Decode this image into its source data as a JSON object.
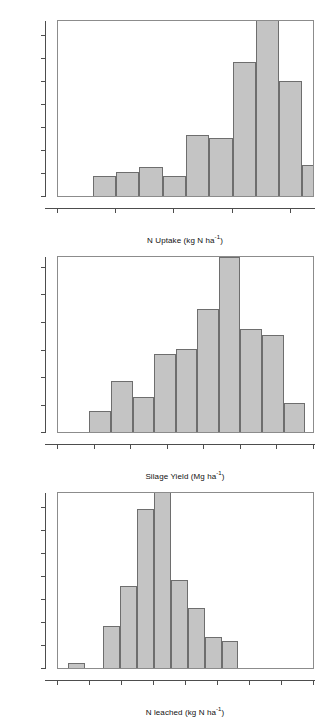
{
  "figure": {
    "panel_count": 3,
    "bar_fill": "#c4c4c4",
    "bar_stroke": "#6e6e6e",
    "axis_color": "#4d4d4d"
  },
  "chart_data": [
    {
      "type": "bar",
      "id": "n-uptake",
      "title": "",
      "xlabel_parts": {
        "pre": "N Uptake (kg N ha",
        "sup": "-1",
        "post": ")"
      },
      "xlabel": "N Uptake (kg N ha-1)",
      "ylabel": "Probability",
      "annotation": "90% Confidence Interval (95,361)",
      "xlim": [
        0,
        440
      ],
      "ylim": [
        0,
        0.2555
      ],
      "grid": false,
      "legend": "none",
      "xticks": [
        0,
        100,
        200,
        300,
        400
      ],
      "xtick_labels": [
        "0",
        "100",
        "200",
        "300",
        "400"
      ],
      "yticks": [
        0.0,
        0.033,
        0.067,
        0.1,
        0.133,
        0.167,
        0.2,
        0.2333
      ],
      "ytick_labels": [
        "0.00",
        "0.03",
        "0.07",
        "0.10",
        "0.13",
        "0.17",
        "0.20",
        "0.24"
      ],
      "bin_edges": [
        60,
        100,
        140,
        180,
        220,
        260,
        300,
        340,
        380,
        420
      ],
      "bin_centers": [
        80,
        120,
        160,
        200,
        240,
        280,
        320,
        360,
        400
      ],
      "values": [
        0.03,
        0.037,
        0.044,
        0.03,
        0.09,
        0.086,
        0.196,
        0.262,
        0.169,
        0.046
      ],
      "bars": [
        {
          "x0": 60,
          "x1": 100,
          "value": 0.03
        },
        {
          "x0": 100,
          "x1": 140,
          "value": 0.037
        },
        {
          "x0": 140,
          "x1": 180,
          "value": 0.044
        },
        {
          "x0": 180,
          "x1": 220,
          "value": 0.03
        },
        {
          "x0": 220,
          "x1": 260,
          "value": 0.09
        },
        {
          "x0": 260,
          "x1": 300,
          "value": 0.086
        },
        {
          "x0": 300,
          "x1": 340,
          "value": 0.196
        },
        {
          "x0": 340,
          "x1": 380,
          "value": 0.262
        },
        {
          "x0": 380,
          "x1": 420,
          "value": 0.169
        },
        {
          "x0": 420,
          "x1": 460,
          "value": 0.046
        }
      ]
    },
    {
      "type": "bar",
      "id": "silage-yield",
      "title": "",
      "xlabel_parts": {
        "pre": "Silage Yield (Mg ha",
        "sup": "-1",
        "post": ")"
      },
      "xlabel": "Silage Yield (Mg ha-1)",
      "ylabel": "Probability",
      "annotation": "90% Confidence Interval (6.5,29.2)",
      "xlim": [
        0,
        35
      ],
      "ylim": [
        0,
        0.2135
      ],
      "grid": false,
      "legend": "none",
      "xticks": [
        0,
        5,
        10,
        15,
        20,
        25,
        30,
        35
      ],
      "xtick_labels": [
        "0",
        "5",
        "10",
        "15",
        "20",
        "25",
        "30",
        "35"
      ],
      "yticks": [
        0.0,
        0.033,
        0.067,
        0.1,
        0.133,
        0.167,
        0.2
      ],
      "ytick_labels": [
        "0.00",
        "0.03",
        "0.07",
        "0.10",
        "0.13",
        "0.17",
        "0.20"
      ],
      "bin_edges": [
        4.3,
        7.25,
        10.2,
        13.15,
        16.1,
        19.05,
        22.0,
        24.95,
        27.9,
        30.85,
        33.8
      ],
      "values": [
        0.027,
        0.063,
        0.044,
        0.096,
        0.102,
        0.151,
        0.214,
        0.126,
        0.119,
        0.036
      ],
      "bars": [
        {
          "x0": 4.3,
          "x1": 7.25,
          "value": 0.027
        },
        {
          "x0": 7.25,
          "x1": 10.2,
          "value": 0.063
        },
        {
          "x0": 10.2,
          "x1": 13.15,
          "value": 0.044
        },
        {
          "x0": 13.15,
          "x1": 16.1,
          "value": 0.096
        },
        {
          "x0": 16.1,
          "x1": 19.05,
          "value": 0.102
        },
        {
          "x0": 19.05,
          "x1": 22.0,
          "value": 0.151
        },
        {
          "x0": 22.0,
          "x1": 24.95,
          "value": 0.214
        },
        {
          "x0": 24.95,
          "x1": 27.9,
          "value": 0.126
        },
        {
          "x0": 27.9,
          "x1": 30.85,
          "value": 0.119
        },
        {
          "x0": 30.85,
          "x1": 33.8,
          "value": 0.036
        }
      ]
    },
    {
      "type": "bar",
      "id": "n-leached",
      "title": "",
      "xlabel_parts": {
        "pre": "N leached (kg N ha",
        "sup": "-1",
        "post": ")"
      },
      "xlabel": "N leached (kg N ha-1)",
      "ylabel": "Probability",
      "annotation": "90% Confidence Interval (148,464)",
      "xlim": [
        0,
        800
      ],
      "ylim": [
        0,
        0.2555
      ],
      "grid": false,
      "legend": "none",
      "xticks": [
        0,
        100,
        200,
        300,
        400,
        500,
        600,
        700,
        800
      ],
      "xtick_labels": [
        "0",
        "100",
        "200",
        "300",
        "400",
        "500",
        "600",
        "700",
        "800"
      ],
      "yticks": [
        0.0,
        0.033,
        0.067,
        0.1,
        0.133,
        0.167,
        0.2,
        0.2333
      ],
      "ytick_labels": [
        "0.00",
        "0.03",
        "0.07",
        "0.10",
        "0.13",
        "0.17",
        "0.20",
        "0.24"
      ],
      "bin_edges": [
        30,
        83,
        140,
        193,
        246,
        299,
        352,
        405,
        458,
        511,
        564
      ],
      "values": [
        0.008,
        0.063,
        0.12,
        0.232,
        0.262,
        0.129,
        0.088,
        0.047,
        0.041
      ],
      "bars": [
        {
          "x0": 30,
          "x1": 83,
          "value": 0.008
        },
        {
          "x0": 140,
          "x1": 193,
          "value": 0.063
        },
        {
          "x0": 193,
          "x1": 246,
          "value": 0.12
        },
        {
          "x0": 246,
          "x1": 299,
          "value": 0.232
        },
        {
          "x0": 299,
          "x1": 352,
          "value": 0.262
        },
        {
          "x0": 352,
          "x1": 405,
          "value": 0.129
        },
        {
          "x0": 405,
          "x1": 458,
          "value": 0.088
        },
        {
          "x0": 458,
          "x1": 511,
          "value": 0.047
        },
        {
          "x0": 511,
          "x1": 564,
          "value": 0.041
        }
      ]
    }
  ]
}
